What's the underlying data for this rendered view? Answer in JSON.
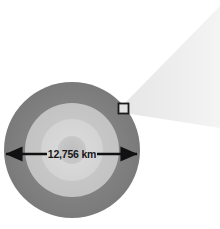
{
  "figure": {
    "name": "earth-cross-section-with-magnifier-callout",
    "background_color": "#ffffff",
    "width": 220,
    "height": 229
  },
  "planet": {
    "label": "Earth",
    "center": {
      "x": 72,
      "y": 150
    },
    "diameter_px": 136,
    "layers": [
      {
        "name": "crust-outer-shell",
        "radius_px": 68,
        "color": "#807f80"
      },
      {
        "name": "mantle-mid-layer",
        "radius_px": 47,
        "color": "#c8c7c7"
      },
      {
        "name": "outer-core",
        "radius_px": 31,
        "color": "#d9d8d8"
      },
      {
        "name": "inner-core",
        "radius_px": 14,
        "color": "#c2c1c1"
      }
    ]
  },
  "dimension": {
    "measurement_label": "12,756 km",
    "arrow_color": "#111113",
    "line_y": 154,
    "left_tip_x": 6,
    "right_tip_x": 137,
    "label_x": 72,
    "label_y": 157
  },
  "callout": {
    "marker_name": "zoom-region-square",
    "marker": {
      "x": 118,
      "y": 103,
      "size": 11
    },
    "border_color": "#1b1b1d",
    "fill_color": "#e3e3e3",
    "cone_name": "magnifier-cone",
    "cone_color": "#efefef",
    "cone_points": "124,104 220,6 220,128 124,113"
  }
}
